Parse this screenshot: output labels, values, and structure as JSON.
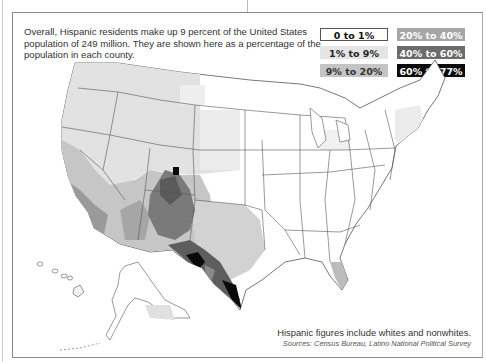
{
  "intro_text": "Overall, Hispanic residents make up 9 percent of the United States population of 249 million. They are shown here as a percentage of the population in each county.",
  "legend": [
    {
      "label": "0 to 1%",
      "fill": "#ffffff",
      "text_color": "#111111",
      "border": "#555555"
    },
    {
      "label": "1% to 9%",
      "fill": "#e4e4e4",
      "text_color": "#222222",
      "border": "#e4e4e4"
    },
    {
      "label": "9% to 20%",
      "fill": "#c4c4c4",
      "text_color": "#333333",
      "border": "#c4c4c4"
    },
    {
      "label": "20% to 40%",
      "fill": "#a6a6a6",
      "text_color": "#ffffff",
      "border": "#a6a6a6"
    },
    {
      "label": "40% to 60%",
      "fill": "#6c6c6c",
      "text_color": "#ffffff",
      "border": "#6c6c6c"
    },
    {
      "label": "60% to 77%",
      "fill": "#0a0a0a",
      "text_color": "#ffffff",
      "border": "#0a0a0a"
    }
  ],
  "footnote": "Hispanic figures include whites and nonwhites.",
  "sources": "Sources: Census Bureau, Latino National Political Survey",
  "map": {
    "title": "Hispanic share of county population, United States",
    "regions": {
      "northeast_midwest": "0 to 1% / 1% to 9%",
      "pacific_northwest_mountain": "1% to 9%",
      "california_arizona": "9% to 20% / 20% to 40%",
      "new_mexico_south_colorado": "40% to 60%",
      "south_texas_border": "60% to 77%",
      "southeast": "0 to 1%",
      "south_florida": "20% to 40%"
    }
  }
}
